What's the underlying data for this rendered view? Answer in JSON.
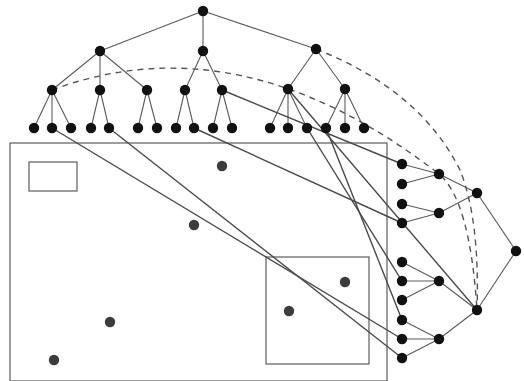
{
  "figure": {
    "colors": {
      "tree_node": "#111111",
      "point": "#3c3c3c",
      "edge": "#5a5a5a",
      "link": "#4a4a4a",
      "region_border": "#5c5c5c",
      "background": "#ffffff"
    }
  },
  "top_tree": {
    "nodes": [
      {
        "id": "r",
        "x": 203,
        "y": 11
      },
      {
        "id": "a",
        "x": 100,
        "y": 51
      },
      {
        "id": "b",
        "x": 203,
        "y": 51
      },
      {
        "id": "c",
        "x": 316,
        "y": 49
      },
      {
        "id": "a1",
        "x": 52,
        "y": 90
      },
      {
        "id": "a2",
        "x": 100,
        "y": 90
      },
      {
        "id": "a3",
        "x": 147,
        "y": 90
      },
      {
        "id": "b1",
        "x": 185,
        "y": 90
      },
      {
        "id": "b2",
        "x": 222,
        "y": 90
      },
      {
        "id": "c1",
        "x": 288,
        "y": 89
      },
      {
        "id": "c2",
        "x": 345,
        "y": 89
      },
      {
        "id": "l1",
        "x": 34,
        "y": 128
      },
      {
        "id": "l2",
        "x": 52,
        "y": 128
      },
      {
        "id": "l3",
        "x": 71,
        "y": 128
      },
      {
        "id": "l4",
        "x": 91,
        "y": 128
      },
      {
        "id": "l5",
        "x": 109,
        "y": 128
      },
      {
        "id": "l6",
        "x": 138,
        "y": 128
      },
      {
        "id": "l7",
        "x": 157,
        "y": 128
      },
      {
        "id": "l8",
        "x": 176,
        "y": 128
      },
      {
        "id": "l9",
        "x": 194,
        "y": 128
      },
      {
        "id": "l10",
        "x": 213,
        "y": 128
      },
      {
        "id": "l11",
        "x": 232,
        "y": 128
      },
      {
        "id": "l12",
        "x": 270,
        "y": 128
      },
      {
        "id": "l13",
        "x": 288,
        "y": 128
      },
      {
        "id": "l14",
        "x": 307,
        "y": 128
      },
      {
        "id": "l15",
        "x": 326,
        "y": 128
      },
      {
        "id": "l16",
        "x": 345,
        "y": 128
      },
      {
        "id": "l17",
        "x": 364,
        "y": 128
      }
    ],
    "edges": [
      [
        "r",
        "a"
      ],
      [
        "r",
        "b"
      ],
      [
        "r",
        "c"
      ],
      [
        "a",
        "a1"
      ],
      [
        "a",
        "a2"
      ],
      [
        "a",
        "a3"
      ],
      [
        "b",
        "b1"
      ],
      [
        "b",
        "b2"
      ],
      [
        "c",
        "c1"
      ],
      [
        "c",
        "c2"
      ],
      [
        "a1",
        "l1"
      ],
      [
        "a1",
        "l2"
      ],
      [
        "a1",
        "l3"
      ],
      [
        "a2",
        "l4"
      ],
      [
        "a2",
        "l5"
      ],
      [
        "a3",
        "l6"
      ],
      [
        "a3",
        "l7"
      ],
      [
        "b1",
        "l8"
      ],
      [
        "b1",
        "l9"
      ],
      [
        "b2",
        "l10"
      ],
      [
        "b2",
        "l11"
      ],
      [
        "c1",
        "l12"
      ],
      [
        "c1",
        "l13"
      ],
      [
        "c1",
        "l14"
      ],
      [
        "c2",
        "l15"
      ],
      [
        "c2",
        "l16"
      ],
      [
        "c2",
        "l17"
      ]
    ]
  },
  "right_tree": {
    "nodes": [
      {
        "id": "R",
        "x": 516,
        "y": 251
      },
      {
        "id": "P1",
        "x": 477,
        "y": 193
      },
      {
        "id": "P2",
        "x": 477,
        "y": 310
      },
      {
        "id": "Q1",
        "x": 439,
        "y": 174
      },
      {
        "id": "Q2",
        "x": 439,
        "y": 213
      },
      {
        "id": "Q3",
        "x": 439,
        "y": 281
      },
      {
        "id": "Q4",
        "x": 439,
        "y": 339
      },
      {
        "id": "k1",
        "x": 402,
        "y": 164
      },
      {
        "id": "k2",
        "x": 402,
        "y": 184
      },
      {
        "id": "k3",
        "x": 402,
        "y": 204
      },
      {
        "id": "k4",
        "x": 402,
        "y": 223
      },
      {
        "id": "k5",
        "x": 402,
        "y": 262
      },
      {
        "id": "k6",
        "x": 402,
        "y": 281
      },
      {
        "id": "k7",
        "x": 402,
        "y": 300
      },
      {
        "id": "k8",
        "x": 402,
        "y": 320
      },
      {
        "id": "k9",
        "x": 402,
        "y": 339
      },
      {
        "id": "k10",
        "x": 402,
        "y": 358
      }
    ],
    "edges": [
      [
        "R",
        "P1"
      ],
      [
        "R",
        "P2"
      ],
      [
        "P1",
        "Q1"
      ],
      [
        "P1",
        "Q2"
      ],
      [
        "P2",
        "Q3"
      ],
      [
        "P2",
        "Q4"
      ],
      [
        "Q1",
        "k1"
      ],
      [
        "Q1",
        "k2"
      ],
      [
        "Q2",
        "k3"
      ],
      [
        "Q2",
        "k4"
      ],
      [
        "Q3",
        "k5"
      ],
      [
        "Q3",
        "k6"
      ],
      [
        "Q3",
        "k7"
      ],
      [
        "Q4",
        "k8"
      ],
      [
        "Q4",
        "k9"
      ],
      [
        "Q4",
        "k10"
      ]
    ]
  },
  "links": [
    {
      "from": [
        52,
        128
      ],
      "to": [
        402,
        339
      ]
    },
    {
      "from": [
        109,
        128
      ],
      "to": [
        402,
        358
      ]
    },
    {
      "from": [
        194,
        128
      ],
      "to": [
        402,
        223
      ]
    },
    {
      "from": [
        222,
        90
      ],
      "to": [
        402,
        164
      ]
    },
    {
      "from": [
        288,
        89
      ],
      "to": [
        477,
        310
      ]
    },
    {
      "from": [
        307,
        128
      ],
      "to": [
        402,
        281
      ]
    },
    {
      "from": [
        326,
        128
      ],
      "to": [
        402,
        320
      ]
    }
  ],
  "arcs": [
    {
      "d": "M 52 90 Q 240 20 439 174 Q 470 200 477 310"
    },
    {
      "d": "M 316 49 Q 420 90 460 170 Q 480 220 477 310"
    }
  ],
  "regions": [
    {
      "name": "outer-region",
      "x": 10,
      "y": 143,
      "w": 377,
      "h": 238
    },
    {
      "name": "small-region",
      "x": 29,
      "y": 162,
      "w": 48,
      "h": 29
    },
    {
      "name": "query-region",
      "x": 266,
      "y": 257,
      "w": 103,
      "h": 107
    }
  ],
  "points": [
    {
      "x": 222,
      "y": 166
    },
    {
      "x": 194,
      "y": 225
    },
    {
      "x": 345,
      "y": 282
    },
    {
      "x": 289,
      "y": 311
    },
    {
      "x": 110,
      "y": 322
    },
    {
      "x": 54,
      "y": 360
    }
  ]
}
